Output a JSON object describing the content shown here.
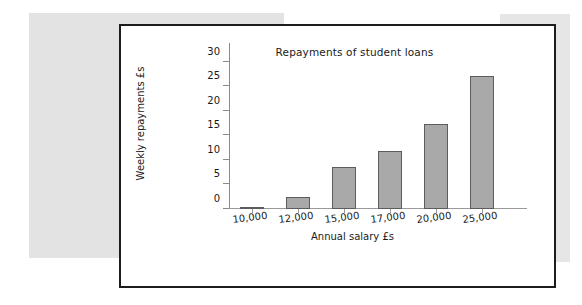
{
  "figure": {
    "background_color": "#ffffff",
    "border_color": "#1d1d1d"
  },
  "chart_data": {
    "type": "bar",
    "title": "Repayments of student loans",
    "xlabel": "Annual salary £s",
    "ylabel": "Weekly repayments £s",
    "categories": [
      "10,000",
      "12,000",
      "15,000",
      "17,000",
      "20,000",
      "25,000"
    ],
    "values": [
      0.2,
      2.5,
      8.5,
      11.8,
      17.3,
      27.2
    ],
    "yticks": [
      0,
      5,
      10,
      15,
      20,
      25,
      30
    ],
    "ytick_labels": [
      "0",
      "5",
      "10",
      "15",
      "20",
      "25",
      "30"
    ],
    "ylim": [
      0,
      32
    ],
    "grid": false,
    "legend": false,
    "bar_fill_color": "#a9a9a9",
    "bar_edge_color": "#5c5c5c",
    "axis_color": "#8a8a8a"
  }
}
